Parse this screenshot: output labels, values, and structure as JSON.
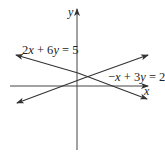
{
  "figure": {
    "type": "linear-system-graph",
    "axes": {
      "x_label": "x",
      "y_label": "y",
      "color": "#333333"
    },
    "lines": [
      {
        "id": "line-1",
        "equation": "2x + 6y = 5",
        "label_parts": [
          "2",
          "x",
          " + 6",
          "y",
          " = 5"
        ],
        "color": "#333333"
      },
      {
        "id": "line-2",
        "equation": "−x + 3y = 2",
        "label_parts": [
          "−",
          "x",
          " + 3",
          "y",
          " = 2"
        ],
        "color": "#333333"
      }
    ]
  }
}
